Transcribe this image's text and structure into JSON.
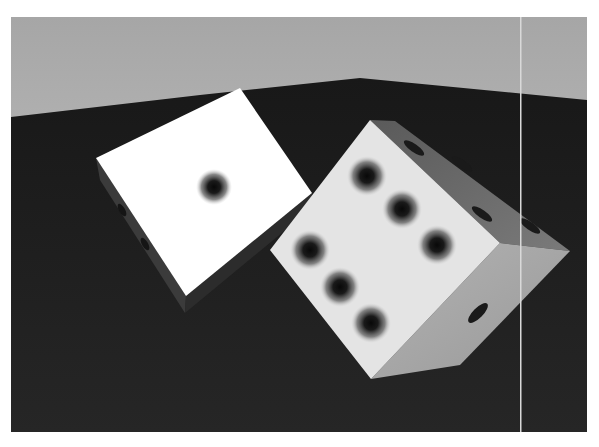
{
  "scene": {
    "description": "Rendered 3D scene of two white dice on a dark wooden table against a grey wall",
    "colors": {
      "wall": "#a9a9a9",
      "table": "#1f1f1f",
      "die_face_bright": "#ffffff",
      "die_face_lit": "#e4e4e4",
      "die_side_mid": "#a8a8a8",
      "die_side_dark": "#6e6e6e",
      "pip": "#111111",
      "vertical_line": "#d9d9d9"
    },
    "dice": [
      {
        "name": "left-die",
        "visible_top_face_value": 1
      },
      {
        "name": "right-die",
        "visible_front_face_value": 5
      }
    ]
  }
}
